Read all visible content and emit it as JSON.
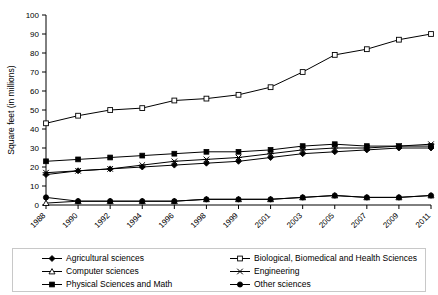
{
  "chart_data": {
    "type": "line",
    "title": "",
    "xlabel": "",
    "ylabel": "Square feet (in millions)",
    "ylim": [
      0,
      100
    ],
    "yticks": [
      0,
      10,
      20,
      30,
      40,
      50,
      60,
      70,
      80,
      90,
      100
    ],
    "grid": false,
    "legend_position": "bottom",
    "categories": [
      "1988",
      "1990",
      "1992",
      "1994",
      "1996",
      "1998",
      "1999",
      "2001",
      "2003",
      "2005",
      "2007",
      "2009",
      "2011"
    ],
    "series": [
      {
        "name": "Agricultural sciences",
        "marker": "filled-diamond",
        "values": [
          16,
          18,
          19,
          20,
          21,
          22,
          23,
          25,
          27,
          28,
          29,
          30,
          30
        ]
      },
      {
        "name": "Biological, Biomedical and Health Sciences",
        "marker": "open-square",
        "values": [
          43,
          47,
          50,
          51,
          55,
          56,
          58,
          62,
          70,
          79,
          82,
          87,
          90
        ]
      },
      {
        "name": "Computer sciences",
        "marker": "open-triangle",
        "values": [
          1,
          2,
          2,
          2,
          2,
          3,
          3,
          3,
          4,
          5,
          4,
          4,
          5
        ]
      },
      {
        "name": "Engineering",
        "marker": "cross-x",
        "values": [
          17,
          18,
          19,
          21,
          23,
          24,
          25,
          27,
          29,
          30,
          30,
          31,
          32
        ]
      },
      {
        "name": "Physical Sciences and Math",
        "marker": "filled-square",
        "values": [
          23,
          24,
          25,
          26,
          27,
          28,
          28,
          29,
          31,
          32,
          31,
          31,
          31
        ]
      },
      {
        "name": "Other sciences",
        "marker": "filled-circle",
        "values": [
          4,
          2,
          2,
          2,
          2,
          3,
          3,
          3,
          4,
          5,
          4,
          4,
          5
        ]
      }
    ]
  },
  "legend": {
    "items": [
      {
        "label": "Agricultural sciences",
        "marker": "filled-diamond",
        "column": 1
      },
      {
        "label": "Biological, Biomedical and Health Sciences",
        "marker": "open-square",
        "column": 2
      },
      {
        "label": "Computer sciences",
        "marker": "open-triangle",
        "column": 1
      },
      {
        "label": "Engineering",
        "marker": "cross-x",
        "column": 2
      },
      {
        "label": "Physical Sciences and Math",
        "marker": "filled-square",
        "column": 1
      },
      {
        "label": "Other sciences",
        "marker": "filled-circle",
        "column": 2
      }
    ]
  },
  "colors": {
    "line": "#000000",
    "axis": "#000000",
    "background": "#ffffff",
    "legend_border": "#c8c8c8"
  }
}
